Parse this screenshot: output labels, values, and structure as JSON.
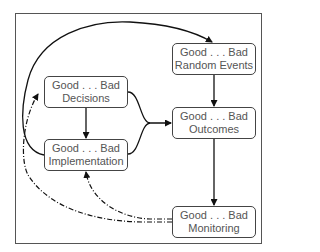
{
  "diagram": {
    "nodes": [
      {
        "id": "random-events",
        "scale": "Good . . . Bad",
        "label": "Random Events"
      },
      {
        "id": "decisions",
        "scale": "Good . . . Bad",
        "label": "Decisions"
      },
      {
        "id": "outcomes",
        "scale": "Good . . . Bad",
        "label": "Outcomes"
      },
      {
        "id": "implementation",
        "scale": "Good . . . Bad",
        "label": "Implementation"
      },
      {
        "id": "monitoring",
        "scale": "Good . . . Bad",
        "label": "Monitoring"
      }
    ],
    "edges": [
      {
        "from": "implementation",
        "to": "random-events",
        "style": "solid"
      },
      {
        "from": "decisions",
        "to": "implementation",
        "style": "solid"
      },
      {
        "from": "decisions",
        "to": "outcomes",
        "style": "solid"
      },
      {
        "from": "implementation",
        "to": "outcomes",
        "style": "solid"
      },
      {
        "from": "random-events",
        "to": "outcomes",
        "style": "solid"
      },
      {
        "from": "outcomes",
        "to": "monitoring",
        "style": "solid"
      },
      {
        "from": "monitoring",
        "to": "decisions",
        "style": "dash-dot"
      },
      {
        "from": "monitoring",
        "to": "implementation",
        "style": "dash-dot"
      }
    ],
    "colors": {
      "line": "#111111",
      "border": "#444444",
      "text": "#555555"
    }
  }
}
